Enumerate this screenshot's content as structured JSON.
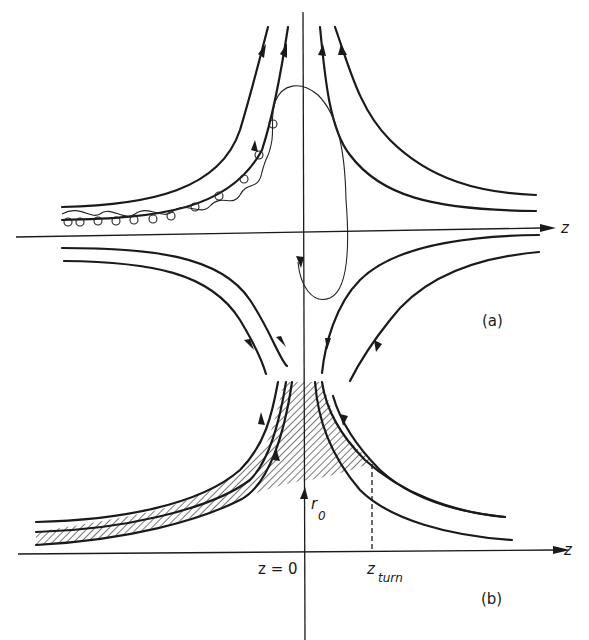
{
  "figure": {
    "panel_a": {
      "label": "(a)",
      "axis_label": "z",
      "description": "Magnetic field lines near a null point with guiding-center particle orbits"
    },
    "panel_b": {
      "label": "(b)",
      "axis_label": "z",
      "origin_label": "z = 0",
      "turn_label": "z",
      "turn_subscript": "turn",
      "radius_label": "r",
      "radius_subscript": "0"
    }
  }
}
